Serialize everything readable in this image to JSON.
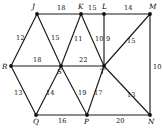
{
  "figure": {
    "background_color": "#ffffff",
    "edge_color": "#1a1a1a",
    "vertex_color": "#111111"
  },
  "graph": {
    "vertices": [
      {
        "id": "J",
        "label": "J",
        "x": 37,
        "y": 14,
        "label_dx": -5,
        "label_dy": -11
      },
      {
        "id": "K",
        "label": "K",
        "x": 81,
        "y": 14,
        "label_dx": -3,
        "label_dy": -11
      },
      {
        "id": "L",
        "label": "L",
        "x": 104,
        "y": 14,
        "label_dx": -2,
        "label_dy": -11
      },
      {
        "id": "M",
        "label": "M",
        "x": 150,
        "y": 14,
        "label_dx": -1,
        "label_dy": -11
      },
      {
        "id": "R",
        "label": "R",
        "x": 11,
        "y": 66,
        "label_dx": -9,
        "label_dy": -3
      },
      {
        "id": "S",
        "label": "S",
        "x": 61,
        "y": 66,
        "label_dx": -4,
        "label_dy": 2
      },
      {
        "id": "T",
        "label": "T",
        "x": 104,
        "y": 66,
        "label_dx": -4,
        "label_dy": 2
      },
      {
        "id": "Q",
        "label": "Q",
        "x": 36,
        "y": 115,
        "label_dx": -3,
        "label_dy": 3
      },
      {
        "id": "P",
        "label": "P",
        "x": 87,
        "y": 115,
        "label_dx": -3,
        "label_dy": 3
      },
      {
        "id": "N",
        "label": "N",
        "x": 150,
        "y": 115,
        "label_dx": -2,
        "label_dy": 3
      }
    ],
    "edges": [
      {
        "from": "J",
        "to": "K",
        "weight": "18",
        "wx": 57,
        "wy": 5
      },
      {
        "from": "K",
        "to": "L",
        "weight": "15",
        "wx": 88,
        "wy": 5
      },
      {
        "from": "L",
        "to": "M",
        "weight": "14",
        "wx": 124,
        "wy": 5
      },
      {
        "from": "R",
        "to": "S",
        "weight": "18",
        "wx": 33,
        "wy": 57
      },
      {
        "from": "S",
        "to": "T",
        "weight": "22",
        "wx": 79,
        "wy": 57
      },
      {
        "from": "Q",
        "to": "P",
        "weight": "16",
        "wx": 58,
        "wy": 118
      },
      {
        "from": "P",
        "to": "N",
        "weight": "20",
        "wx": 116,
        "wy": 118
      },
      {
        "from": "J",
        "to": "R",
        "weight": "12",
        "wx": 16,
        "wy": 35
      },
      {
        "from": "J",
        "to": "S",
        "weight": "15",
        "wx": 51,
        "wy": 35
      },
      {
        "from": "K",
        "to": "S",
        "weight": "11",
        "wx": 74,
        "wy": 36
      },
      {
        "from": "K",
        "to": "T",
        "weight": "10",
        "wx": 95,
        "wy": 36
      },
      {
        "from": "L",
        "to": "T",
        "weight": "9",
        "wx": 106,
        "wy": 36
      },
      {
        "from": "M",
        "to": "T",
        "weight": "15",
        "wx": 127,
        "wy": 38
      },
      {
        "from": "M",
        "to": "N",
        "weight": "10",
        "wx": 153,
        "wy": 64
      },
      {
        "from": "R",
        "to": "Q",
        "weight": "13",
        "wx": 14,
        "wy": 90
      },
      {
        "from": "S",
        "to": "Q",
        "weight": "14",
        "wx": 46,
        "wy": 90
      },
      {
        "from": "S",
        "to": "P",
        "weight": "19",
        "wx": 78,
        "wy": 90
      },
      {
        "from": "T",
        "to": "P",
        "weight": "17",
        "wx": 94,
        "wy": 90
      },
      {
        "from": "T",
        "to": "N",
        "weight": "13",
        "wx": 127,
        "wy": 92
      }
    ]
  }
}
